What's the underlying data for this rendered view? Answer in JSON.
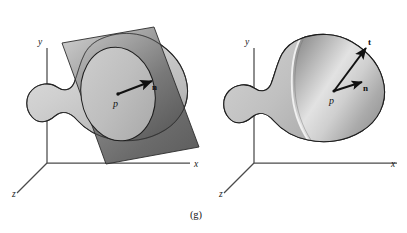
{
  "figure": {
    "caption": "(g)",
    "panels": [
      {
        "id": "left",
        "name": "tangent-plane-panel",
        "axes": {
          "x_label": "x",
          "y_label": "y",
          "z_label": "z"
        },
        "point_label": "p",
        "vectors": [
          {
            "name": "normal",
            "label": "n"
          }
        ],
        "objects": [
          "blob-solid",
          "tangent-plane",
          "intersection-ellipse"
        ]
      },
      {
        "id": "right",
        "name": "cut-surface-panel",
        "axes": {
          "x_label": "x",
          "y_label": "y",
          "z_label": "z"
        },
        "point_label": "p",
        "vectors": [
          {
            "name": "normal",
            "label": "n"
          },
          {
            "name": "tangent",
            "label": "t"
          }
        ],
        "objects": [
          "blob-solid",
          "cut-surface"
        ]
      }
    ],
    "colors": {
      "background": "#ffffff",
      "axis_line": "#4a4a4a",
      "outline": "#1e1e1e",
      "blob_light": "#d8d8d8",
      "blob_mid": "#b9b9b9",
      "blob_dark": "#9a9a9a",
      "plane_light": "#bdbdbd",
      "plane_dark": "#4f4f4f",
      "vector_stroke": "#111111",
      "text": "#1a1a1a"
    }
  }
}
